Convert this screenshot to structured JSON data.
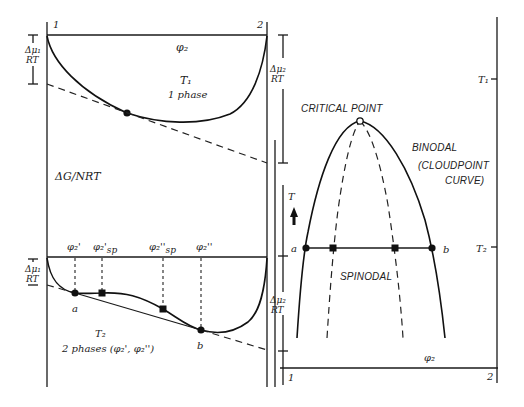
{
  "figure": {
    "left_panel": {
      "axis_label": "ΔG/NRT",
      "composition_ends": {
        "left": "1",
        "right": "2"
      },
      "upper": {
        "x_label": "φ₂",
        "temperature": "T₁",
        "state": "1 phase",
        "chem_potential_left": {
          "top": "Δμ₁",
          "bottom": "RT"
        },
        "chem_potential_right": {
          "top": "Δμ₂",
          "bottom": "RT"
        }
      },
      "lower": {
        "temperature": "T₂",
        "state": "2 phases (φ₂', φ₂'')",
        "markers": [
          "φ₂'",
          "φ₂'sp",
          "φ₂''sp",
          "φ₂''"
        ],
        "marker_main": [
          "φ₂'",
          "φ₂'",
          "φ₂''",
          "φ₂''"
        ],
        "marker_sub": [
          "",
          "sp",
          "sp",
          ""
        ],
        "point_a": "a",
        "point_b": "b",
        "chem_potential_left": {
          "top": "Δμ₁",
          "bottom": "RT"
        },
        "chem_potential_right": {
          "top": "Δμ₂",
          "bottom": "RT"
        }
      }
    },
    "right_panel": {
      "t_axis_label": "T",
      "x_label": "φ₂",
      "composition_ends": {
        "left": "1",
        "right": "2"
      },
      "t1_label": "T₁",
      "t2_label": "T₂",
      "critical_point": "CRITICAL POINT",
      "binodal": "BINODAL",
      "cloudpoint_1": "(CLOUDPOINT",
      "cloudpoint_2": "CURVE)",
      "spinodal": "SPINODAL",
      "point_a": "a",
      "point_b": "b"
    }
  }
}
